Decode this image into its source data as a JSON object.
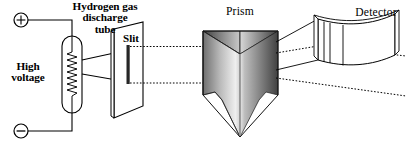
{
  "figure": {
    "background_color": "#ffffff",
    "stroke_color": "#000000",
    "width": 406,
    "height": 151
  },
  "labels": {
    "hydrogen_tube": "Hydrogen gas\ndischarge\ntube",
    "high_voltage": "High\nvoltage",
    "slit": "Slit",
    "prism": "Prism",
    "detector": "Detector"
  },
  "components": {
    "positive_terminal": {
      "symbol": "+",
      "name": "positive-terminal",
      "cx": 21,
      "cy": 20,
      "r": 7
    },
    "negative_terminal": {
      "symbol": "−",
      "name": "negative-terminal",
      "cx": 21,
      "cy": 131,
      "r": 7
    },
    "discharge_tube": {
      "shape": "stadium",
      "x": 62,
      "y": 36,
      "width": 20,
      "height": 77,
      "filament": "zigzag-coil"
    },
    "slit_plate": {
      "shape": "parallelogram-plane",
      "slit_color": "#2b2b2b"
    },
    "prism": {
      "shape": "triangular-prism",
      "shading": "gradient-gray",
      "light_face": "#f2f2f2",
      "dark_face": "#4a4a4a"
    },
    "detector": {
      "shape": "curved-film-strip",
      "spectral_lines": 3
    }
  },
  "rays": {
    "style": "dotted",
    "upper_ray_y": 50,
    "lower_ray_y": 78,
    "beam_from_tube": "solid-cone"
  }
}
